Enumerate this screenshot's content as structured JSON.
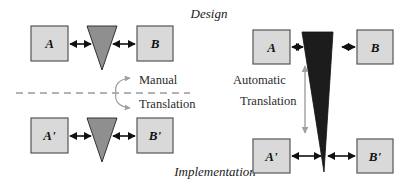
{
  "title_top": "Design",
  "title_bottom": "Implementation",
  "colors": {
    "box_fill": "#d9d9d9",
    "box_stroke": "#555555",
    "manual_connector": "#8f8f8f",
    "automatic_connector": "#1c1c1c",
    "translation_arrow": "#a0a0a0",
    "arrow": "#111111"
  },
  "left_panel": {
    "design_row": {
      "left": "A",
      "right": "B"
    },
    "implementation_row": {
      "left": "A'",
      "right": "B'"
    },
    "translation_label_1": "Manual",
    "translation_label_2": "Translation"
  },
  "right_panel": {
    "design_row": {
      "left": "A",
      "right": "B"
    },
    "implementation_row": {
      "left": "A'",
      "right": "B'"
    },
    "translation_label_1": "Automatic",
    "translation_label_2": "Translation"
  }
}
